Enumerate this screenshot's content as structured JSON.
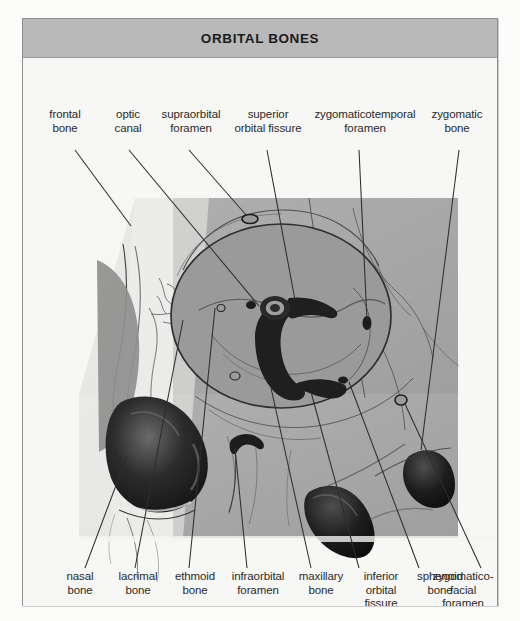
{
  "figure": {
    "title": "ORBITAL BONES",
    "type": "anatomical-illustration",
    "colors": {
      "page_background": "#fbfbfa",
      "frame_border": "#8d8d8d",
      "title_bar": "#b9b9b9",
      "title_text": "#1b1b1b",
      "illustration_background": "#a8a8a8",
      "orbit_fill": "#9a9a9a",
      "deep_shadow": "#1e1e1e",
      "label_text": "#2a2a2a",
      "leader_line": "#2e2e2e"
    }
  },
  "labels_top": [
    {
      "id": "frontal-bone",
      "text": "frontal\nbone",
      "x": 42,
      "y": 60
    },
    {
      "id": "optic-canal",
      "text": "optic\ncanal",
      "x": 104,
      "y": 60
    },
    {
      "id": "supraorbital-foramen",
      "text": "supraorbital\nforamen",
      "x": 148,
      "y": 60
    },
    {
      "id": "superior-orbital-fissure",
      "text": "superior\norbital fissure",
      "x": 236,
      "y": 60
    },
    {
      "id": "zygomaticotemporal-foramen",
      "text": "zygomaticotemporal\nforamen",
      "x": 314,
      "y": 60
    },
    {
      "id": "zygomatic-bone",
      "text": "zygomatic\nbone",
      "x": 434,
      "y": 60
    }
  ],
  "labels_bottom": [
    {
      "id": "nasal-bone",
      "text": "nasal\nbone",
      "x": 60,
      "y": 520
    },
    {
      "id": "lacrimal-bone",
      "text": "lacrimal\nbone",
      "x": 113,
      "y": 520
    },
    {
      "id": "ethmoid-bone",
      "text": "ethmoid\nbone",
      "x": 168,
      "y": 520
    },
    {
      "id": "infraorbital-foramen",
      "text": "infraorbital\nforamen",
      "x": 225,
      "y": 520
    },
    {
      "id": "maxillary-bone",
      "text": "maxillary\nbone",
      "x": 290,
      "y": 520
    },
    {
      "id": "inferior-orbital-fissure",
      "text": "inferior\norbital\nfissure",
      "x": 340,
      "y": 520
    },
    {
      "id": "sphenoid-bone",
      "text": "sphenoid\nbone",
      "x": 400,
      "y": 520
    },
    {
      "id": "zygomaticofacial-foramen",
      "text": "zygomatico-\nfacial\nforamen",
      "x": 462,
      "y": 520
    }
  ],
  "structures": [
    "frontal bone",
    "optic canal",
    "supraorbital foramen",
    "superior orbital fissure",
    "zygomaticotemporal foramen",
    "zygomatic bone",
    "nasal bone",
    "lacrimal bone",
    "ethmoid bone",
    "infraorbital foramen",
    "maxillary bone",
    "inferior orbital fissure",
    "sphenoid bone",
    "zygomaticofacial foramen"
  ],
  "ghost_text": "the orbit is the bony socket that surrounds and protects the globe seven bones contribute to the orbital walls the roof floor medial and lateral walls the medial wall is the thinnest portion formed largely by the lamina papyracea of the ethmoid bone blowout fractures commonly involve the floor and medial wall of the orbit"
}
